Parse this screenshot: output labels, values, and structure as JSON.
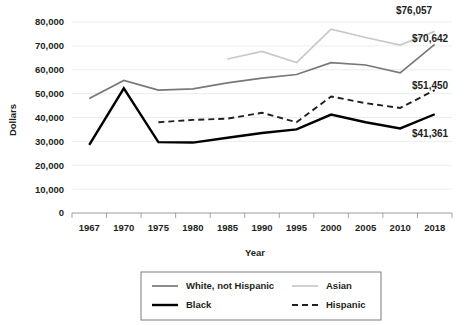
{
  "chart_data": {
    "type": "line",
    "title": "",
    "xlabel": "Year",
    "ylabel": "Dollars",
    "categories": [
      "1967",
      "1970",
      "1975",
      "1980",
      "1985",
      "1990",
      "1995",
      "2000",
      "2005",
      "2010",
      "2018"
    ],
    "ylim": [
      0,
      80000
    ],
    "ytick_labels": [
      "0",
      "10,000",
      "20,000",
      "30,000",
      "40,000",
      "50,000",
      "60,000",
      "70,000",
      "80,000"
    ],
    "ytick_values": [
      0,
      10000,
      20000,
      30000,
      40000,
      50000,
      60000,
      70000,
      80000
    ],
    "grid": true,
    "legend_position": "bottom",
    "series": [
      {
        "name": "White, not Hispanic",
        "color": "#77787b",
        "style": "solid",
        "width": 1.7,
        "values": [
          48000,
          55500,
          51500,
          52000,
          54500,
          56500,
          58000,
          63000,
          62000,
          58700,
          70642
        ],
        "end_label": "$70,642"
      },
      {
        "name": "Asian",
        "color": "#c7c8ca",
        "style": "solid",
        "width": 1.7,
        "values": [
          null,
          null,
          null,
          null,
          64500,
          67700,
          63000,
          77000,
          73500,
          70300,
          76057
        ],
        "end_label": "$76,057"
      },
      {
        "name": "Black",
        "color": "#000000",
        "style": "solid",
        "width": 2.4,
        "values": [
          28500,
          52200,
          29700,
          29500,
          31500,
          33500,
          35000,
          41200,
          38000,
          35400,
          41361
        ],
        "end_label": "$41,361"
      },
      {
        "name": "Hispanic",
        "color": "#231f20",
        "style": "dashed",
        "width": 1.9,
        "values": [
          null,
          null,
          38000,
          39000,
          39500,
          42000,
          38000,
          48800,
          46000,
          44000,
          51450
        ],
        "end_label": "$51,450"
      }
    ],
    "annotations": [
      {
        "text": "$76,057",
        "x": 396,
        "y": 14
      },
      {
        "text": "$70,642",
        "x": 412,
        "y": 42
      },
      {
        "text": "$51,450",
        "x": 412,
        "y": 89
      },
      {
        "text": "$41,361",
        "x": 412,
        "y": 137
      }
    ]
  },
  "legend": {
    "items": [
      {
        "label": "White, not Hispanic"
      },
      {
        "label": "Asian"
      },
      {
        "label": "Black"
      },
      {
        "label": "Hispanic"
      }
    ]
  }
}
